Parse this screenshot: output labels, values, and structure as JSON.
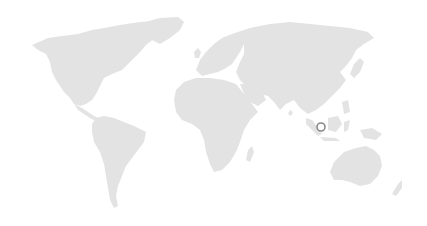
{
  "map": {
    "type": "world-map",
    "colors": {
      "background": "#ffffff",
      "land": "#e3e3e3",
      "marker": "#8a8a8a"
    },
    "markers": [
      {
        "name": "singapore-marker",
        "x": 321,
        "y": 127,
        "r": 4
      }
    ]
  }
}
